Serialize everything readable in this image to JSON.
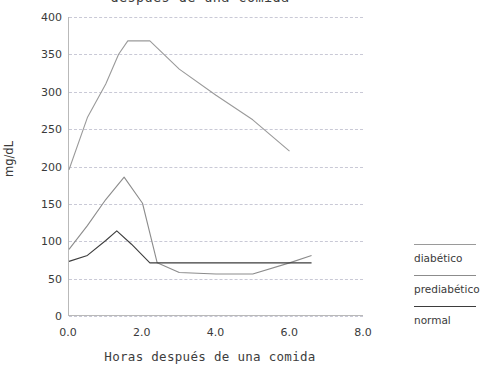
{
  "chart_data": {
    "type": "line",
    "title": "después de una comida",
    "xlabel": "Horas después de una comida",
    "ylabel": "mg/dL",
    "xlim": [
      0,
      8
    ],
    "ylim": [
      0,
      400
    ],
    "xticks": [
      "0.0",
      "2.0",
      "4.0",
      "6.0",
      "8.0"
    ],
    "xtick_values": [
      0,
      2,
      4,
      6,
      8
    ],
    "yticks": [
      "0",
      "50",
      "100",
      "150",
      "200",
      "250",
      "300",
      "350",
      "400"
    ],
    "ytick_values": [
      0,
      50,
      100,
      150,
      200,
      250,
      300,
      350,
      400
    ],
    "grid": true,
    "grid_axis": "y",
    "legend_position": "right",
    "series": [
      {
        "name": "diabético",
        "color": "#9a9a9a",
        "x": [
          0.0,
          0.5,
          1.0,
          1.35,
          1.6,
          2.2,
          3.0,
          4.0,
          5.0,
          6.0
        ],
        "values": [
          195,
          265,
          310,
          350,
          368,
          368,
          330,
          295,
          262,
          220
        ]
      },
      {
        "name": "prediabético",
        "color": "#8c8c8c",
        "x": [
          0.0,
          0.5,
          1.0,
          1.5,
          2.0,
          2.4,
          3.0,
          4.0,
          5.0,
          6.0,
          6.6
        ],
        "values": [
          88,
          120,
          155,
          185,
          150,
          70,
          57,
          55,
          55,
          70,
          80
        ]
      },
      {
        "name": "normal",
        "color": "#3d3d3d",
        "x": [
          0.0,
          0.5,
          1.0,
          1.3,
          1.7,
          2.2,
          3.0,
          4.0,
          5.0,
          6.0,
          6.6
        ],
        "values": [
          72,
          80,
          100,
          113,
          95,
          70,
          70,
          70,
          70,
          70,
          70
        ]
      }
    ]
  },
  "legend": {
    "items": [
      {
        "label": "diabético",
        "color": "#9a9a9a"
      },
      {
        "label": "prediabético",
        "color": "#8c8c8c"
      },
      {
        "label": "normal",
        "color": "#3d3d3d"
      }
    ]
  }
}
